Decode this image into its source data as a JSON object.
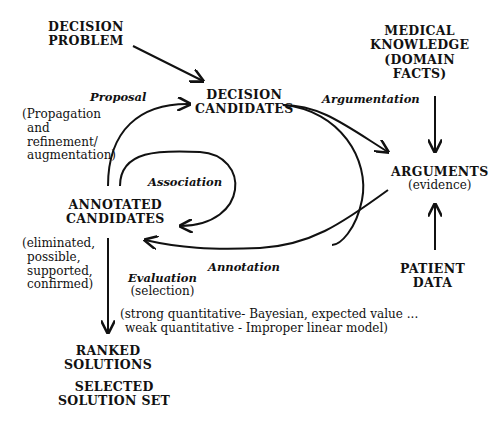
{
  "nodes": {
    "decision_problem": [
      "DECISION",
      "PROBLEM"
    ],
    "decision_candidates": [
      "DECISION",
      "CANDIDATES"
    ],
    "medical_knowledge": [
      "MEDICAL",
      "KNOWLEDGE",
      "(DOMAIN",
      "FACTS)"
    ],
    "arguments": {
      "title": "ARGUMENTS",
      "sub": "(evidence)"
    },
    "annotated_candidates": [
      "ANNOTATED",
      "CANDIDATES"
    ],
    "patient_data": [
      "PATIENT",
      "DATA"
    ],
    "ranked_solutions": [
      "RANKED",
      "SOLUTIONS"
    ],
    "selected_solution_set": [
      "SELECTED",
      "SOLUTION SET"
    ]
  },
  "edge_labels": {
    "proposal": "Proposal",
    "argumentation": "Argumentation",
    "association": "Association",
    "annotation": "Annotation",
    "evaluation": "Evaluation",
    "evaluation_sub": "(selection)"
  },
  "notes": {
    "proposal_note": [
      "(Propagation",
      "and",
      "refinement/",
      "augmentation)"
    ],
    "status_note": [
      "(eliminated,",
      "possible,",
      "supported,",
      "confirmed)"
    ],
    "methods_note": [
      "(strong quantitative- Bayesian, expected value ...",
      "weak quantitative - Improper linear model)"
    ]
  }
}
